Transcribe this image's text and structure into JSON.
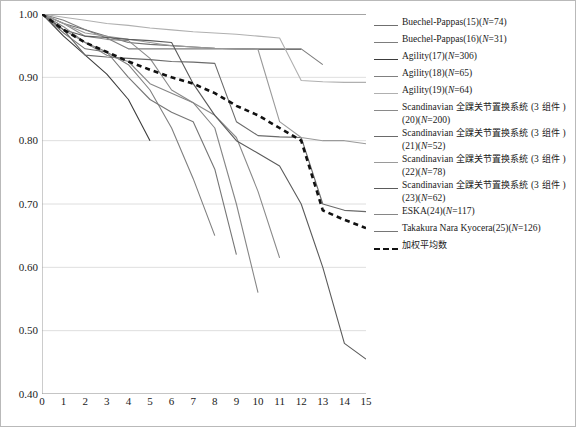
{
  "chart_data": {
    "type": "line",
    "title": "",
    "xlabel": "",
    "ylabel": "",
    "xlim": [
      0,
      15
    ],
    "ylim": [
      0.4,
      1.0
    ],
    "grid": true,
    "legend_position": "right",
    "yticks": [
      "1.00",
      "0.90",
      "0.80",
      "0.70",
      "0.60",
      "0.50",
      "0.40"
    ],
    "ytick_values": [
      1.0,
      0.9,
      0.8,
      0.7,
      0.6,
      0.5,
      0.4
    ],
    "xticks": [
      "0",
      "1",
      "2",
      "3",
      "4",
      "5",
      "6",
      "7",
      "8",
      "9",
      "10",
      "11",
      "12",
      "13",
      "14",
      "15"
    ],
    "xtick_values": [
      0,
      1,
      2,
      3,
      4,
      5,
      6,
      7,
      8,
      9,
      10,
      11,
      12,
      13,
      14,
      15
    ],
    "series": [
      {
        "name": "Buechel-Pappas(15)(N=74)",
        "color": "#6f6f6f",
        "dash": "none",
        "x": [
          0,
          1,
          2,
          3,
          4,
          5,
          6,
          7,
          8,
          9,
          10,
          11,
          12
        ],
        "values": [
          1.0,
          0.985,
          0.975,
          0.965,
          0.955,
          0.952,
          0.95,
          0.948,
          0.946,
          0.945,
          0.944,
          0.944,
          0.944
        ]
      },
      {
        "name": "Buechel-Pappas(16)(N=31)",
        "color": "#7d7d7d",
        "dash": "none",
        "x": [
          0,
          1,
          2,
          3,
          4,
          5,
          6,
          7,
          8,
          9,
          10,
          11,
          12,
          13
        ],
        "values": [
          1.0,
          0.99,
          0.975,
          0.962,
          0.945,
          0.945,
          0.945,
          0.945,
          0.945,
          0.945,
          0.945,
          0.945,
          0.945,
          0.92
        ]
      },
      {
        "name": "Agility(17)(N=306)",
        "color": "#3c3c3c",
        "dash": "none",
        "x": [
          0,
          1,
          2,
          3,
          4,
          5
        ],
        "values": [
          1.0,
          0.965,
          0.935,
          0.905,
          0.865,
          0.8
        ]
      },
      {
        "name": "Agility(18)(N=65)",
        "color": "#808080",
        "dash": "none",
        "x": [
          0,
          1,
          2,
          3,
          4,
          5,
          6,
          7,
          8
        ],
        "values": [
          1.0,
          0.975,
          0.955,
          0.94,
          0.92,
          0.88,
          0.82,
          0.74,
          0.65
        ]
      },
      {
        "name": "Agility(19)(N=64)",
        "color": "#b0b0b0",
        "dash": "none",
        "x": [
          0,
          1,
          2,
          3,
          4,
          5,
          6,
          7,
          8,
          9,
          10,
          11,
          12,
          13,
          14,
          15
        ],
        "values": [
          1.0,
          0.995,
          0.99,
          0.985,
          0.982,
          0.978,
          0.975,
          0.972,
          0.97,
          0.968,
          0.965,
          0.962,
          0.895,
          0.893,
          0.892,
          0.892
        ]
      },
      {
        "name": "Scandinavian 全踝关节置换系统 (3 组件 )(20)(N=200)",
        "color": "#8a8a8a",
        "dash": "none",
        "x": [
          0,
          1,
          2,
          3,
          4,
          5,
          6,
          7,
          8,
          9,
          10,
          11
        ],
        "values": [
          1.0,
          0.985,
          0.965,
          0.96,
          0.958,
          0.93,
          0.88,
          0.86,
          0.84,
          0.805,
          0.72,
          0.615
        ]
      },
      {
        "name": "Scandinavian 全踝关节置换系统 (3 组件 )(21)(N=52)",
        "color": "#6a6a6a",
        "dash": "none",
        "x": [
          0,
          1,
          2,
          3,
          4,
          5,
          6,
          7,
          8,
          9,
          10,
          11,
          12,
          13,
          14,
          15
        ],
        "values": [
          1.0,
          0.975,
          0.935,
          0.932,
          0.93,
          0.928,
          0.925,
          0.924,
          0.922,
          0.83,
          0.808,
          0.806,
          0.805,
          0.7,
          0.69,
          0.688
        ]
      },
      {
        "name": "Scandinavian 全踝关节置换系统 (3 组件 )(22)(N=78)",
        "color": "#9a9a9a",
        "dash": "none",
        "x": [
          0,
          1,
          2,
          3,
          4,
          5,
          6,
          7,
          8,
          9,
          10,
          11,
          12,
          13,
          14,
          15
        ],
        "values": [
          1.0,
          0.985,
          0.97,
          0.965,
          0.96,
          0.955,
          0.95,
          0.948,
          0.946,
          0.945,
          0.944,
          0.83,
          0.805,
          0.8,
          0.8,
          0.795
        ]
      },
      {
        "name": "Scandinavian 全踝关节置换系统 (3 组件 )(23)(N=62)",
        "color": "#5b5b5b",
        "dash": "none",
        "x": [
          0,
          1,
          2,
          3,
          4,
          5,
          6,
          7,
          8,
          9,
          10,
          11,
          12,
          13,
          14,
          15
        ],
        "values": [
          1.0,
          0.975,
          0.965,
          0.963,
          0.96,
          0.958,
          0.955,
          0.89,
          0.84,
          0.8,
          0.78,
          0.76,
          0.7,
          0.6,
          0.48,
          0.455
        ]
      },
      {
        "name": "ESKA(24)(N=117)",
        "color": "#868686",
        "dash": "none",
        "x": [
          0,
          1,
          2,
          3,
          4,
          5,
          6,
          7,
          8,
          9,
          10
        ],
        "values": [
          1.0,
          0.98,
          0.955,
          0.935,
          0.925,
          0.89,
          0.875,
          0.86,
          0.82,
          0.7,
          0.56
        ]
      },
      {
        "name": "Takakura Nara Kyocera(25)(N=126)",
        "color": "#767676",
        "dash": "none",
        "x": [
          0,
          1,
          2,
          3,
          4,
          5,
          6,
          7,
          8,
          9
        ],
        "values": [
          1.0,
          0.97,
          0.945,
          0.94,
          0.9,
          0.865,
          0.845,
          0.83,
          0.755,
          0.62
        ]
      },
      {
        "name": "加权平均数",
        "color": "#111111",
        "dash": "dashed",
        "x": [
          0,
          1,
          2,
          3,
          4,
          5,
          6,
          7,
          8,
          9,
          10,
          11,
          12,
          13,
          14,
          15
        ],
        "values": [
          1.0,
          0.975,
          0.955,
          0.94,
          0.925,
          0.912,
          0.9,
          0.89,
          0.875,
          0.855,
          0.84,
          0.82,
          0.8,
          0.69,
          0.675,
          0.662
        ]
      }
    ]
  },
  "legend": {
    "items": [
      {
        "label": "Buechel-Pappas(15)(",
        "ital": "N",
        "tail": "=74)",
        "color": "#6f6f6f",
        "dash": "none"
      },
      {
        "label": "Buechel-Pappas(16)(",
        "ital": "N",
        "tail": "=31)",
        "color": "#7d7d7d",
        "dash": "none"
      },
      {
        "label": "Agility(17)(",
        "ital": "N",
        "tail": "=306)",
        "color": "#3c3c3c",
        "dash": "none"
      },
      {
        "label": "Agility(18)(",
        "ital": "N",
        "tail": "=65)",
        "color": "#808080",
        "dash": "none"
      },
      {
        "label": "Agility(19)(",
        "ital": "N",
        "tail": "=64)",
        "color": "#b0b0b0",
        "dash": "none"
      },
      {
        "label": "Scandinavian 全踝关节置换系统 (3 组件 )(20)(",
        "ital": "N",
        "tail": "=200)",
        "color": "#8a8a8a",
        "dash": "none"
      },
      {
        "label": "Scandinavian 全踝关节置换系统 (3 组件 )(21)(",
        "ital": "N",
        "tail": "=52)",
        "color": "#6a6a6a",
        "dash": "none"
      },
      {
        "label": "Scandinavian 全踝关节置换系统 (3 组件 )(22)(",
        "ital": "N",
        "tail": "=78)",
        "color": "#9a9a9a",
        "dash": "none"
      },
      {
        "label": "Scandinavian 全踝关节置换系统 (3 组件 )(23)(",
        "ital": "N",
        "tail": "=62)",
        "color": "#5b5b5b",
        "dash": "none"
      },
      {
        "label": "ESKA(24)(",
        "ital": "N",
        "tail": "=117)",
        "color": "#868686",
        "dash": "none"
      },
      {
        "label": "Takakura Nara Kyocera(25)(",
        "ital": "N",
        "tail": "=126)",
        "color": "#767676",
        "dash": "none"
      },
      {
        "label": "加权平均数",
        "ital": "",
        "tail": "",
        "color": "#111111",
        "dash": "dashed"
      }
    ]
  },
  "colors": {
    "grid": "#d6d6d6",
    "axis": "#9a9a9a",
    "background": "#ffffff",
    "border": "#b9b9b9"
  }
}
